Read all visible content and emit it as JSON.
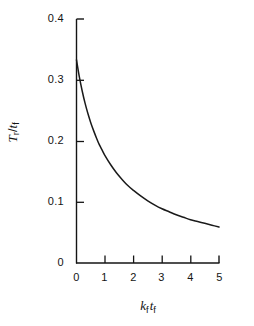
{
  "figure": {
    "background_color": "#ffffff",
    "ink_color": "#141414",
    "curve_color": "#1a1a1a"
  },
  "axis": {
    "y_label_parts": {
      "numerator": "T",
      "numerator_sub": "r",
      "slash": "/",
      "denominator": "t",
      "denominator_sub": "f"
    },
    "y_label_text": "Tr / tf",
    "x_label_parts": {
      "first": "k",
      "first_sub": "f",
      "second": "t",
      "second_sub": "f"
    },
    "x_label_text": "kf tf"
  },
  "caption": {
    "text": ""
  },
  "chart_data": {
    "type": "line",
    "title": "",
    "subtitle": "",
    "xlabel": "k_f t_f",
    "ylabel": "tau_r / t_f",
    "xlim": [
      0,
      5
    ],
    "ylim": [
      0,
      0.4
    ],
    "xticks": [
      0,
      1,
      2,
      3,
      4,
      5
    ],
    "xtick_labels": [
      "0",
      "1",
      "2",
      "3",
      "4",
      "5"
    ],
    "yticks": [
      0,
      0.1,
      0.2,
      0.3,
      0.4
    ],
    "ytick_labels": [
      "0",
      "0.1",
      "0.2",
      "0.3",
      "0.4"
    ],
    "grid": false,
    "legend": null,
    "legend_position": "none",
    "tick_direction": "in",
    "spines": [
      "left",
      "bottom"
    ],
    "series": [
      {
        "name": "tau_r / t_f",
        "x": [
          0.0,
          0.1,
          0.2,
          0.3,
          0.4,
          0.5,
          0.6,
          0.7,
          0.8,
          0.9,
          1.0,
          1.2,
          1.4,
          1.6,
          1.8,
          2.0,
          2.25,
          2.5,
          2.75,
          3.0,
          3.25,
          3.5,
          3.75,
          4.0,
          4.25,
          4.5,
          4.75,
          5.0
        ],
        "y": [
          0.333,
          0.305,
          0.282,
          0.262,
          0.245,
          0.23,
          0.217,
          0.205,
          0.194,
          0.185,
          0.176,
          0.161,
          0.148,
          0.137,
          0.127,
          0.119,
          0.11,
          0.102,
          0.095,
          0.089,
          0.084,
          0.079,
          0.075,
          0.071,
          0.068,
          0.065,
          0.062,
          0.059
        ]
      }
    ],
    "annotations": []
  }
}
